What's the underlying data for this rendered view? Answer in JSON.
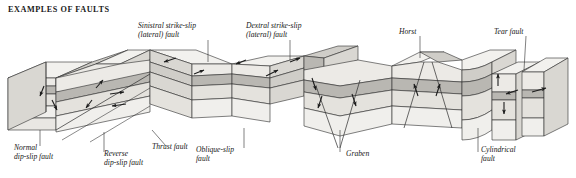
{
  "figure": {
    "title": "EXAMPLES OF FAULTS",
    "background_color": "#ffffff",
    "ink_color": "#161616"
  },
  "labels": {
    "sinistral": "Sinistral strike-slip\n(lateral) fault",
    "dextral": "Dextral strike-slip\n(lateral) fault",
    "horst": "Horst",
    "tear": "Tear fault",
    "normal": "Normal\ndip-slip fault",
    "reverse": "Reverse\ndip-slip fault",
    "thrust": "Thrust fault",
    "oblique": "Oblique-slip\nfault",
    "graben": "Graben",
    "cylindrical": "Cylindrical\nfault"
  },
  "strata": {
    "top_surface": "#f2f1ee",
    "layer_1": "#eceae6",
    "layer_2_dark_band": "#b9b7b2",
    "layer_3": "#e4e2dd",
    "layer_4": "#f0efec",
    "layer_5": "#e9e7e3",
    "fault_face": "#cfcdc8",
    "side_shade": "#d9d7d2",
    "outline": "#2b2b2b"
  },
  "leaders": {
    "stroke": "#2b2b2b",
    "width": 0.6
  }
}
